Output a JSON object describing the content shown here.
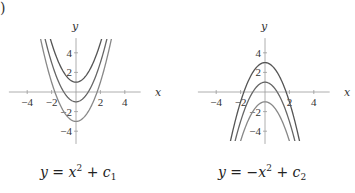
{
  "panel_label": ")",
  "chart_data": [
    {
      "type": "line",
      "title": "",
      "caption": "y = x^2 + c_1",
      "xlabel": "x",
      "ylabel": "y",
      "xlim": [
        -5,
        5
      ],
      "ylim": [
        -5,
        5
      ],
      "xticks": [
        -4,
        -2,
        2,
        4
      ],
      "yticks": [
        -4,
        -2,
        2,
        4
      ],
      "grid": false,
      "series": [
        {
          "name": "c1 = 1",
          "formula": "x^2 + 1",
          "c": 1
        },
        {
          "name": "c1 = -1",
          "formula": "x^2 - 1",
          "c": -1
        },
        {
          "name": "c1 = -3",
          "formula": "x^2 - 3",
          "c": -3
        }
      ],
      "sign": 1
    },
    {
      "type": "line",
      "title": "",
      "caption": "y = -x^2 + c_2",
      "xlabel": "x",
      "ylabel": "y",
      "xlim": [
        -5,
        5
      ],
      "ylim": [
        -5,
        5
      ],
      "xticks": [
        -4,
        -2,
        2,
        4
      ],
      "yticks": [
        -4,
        -2,
        2,
        4
      ],
      "grid": false,
      "series": [
        {
          "name": "c2 = 3",
          "formula": "-x^2 + 3",
          "c": 3
        },
        {
          "name": "c2 = 1",
          "formula": "-x^2 + 1",
          "c": 1
        },
        {
          "name": "c2 = -1",
          "formula": "-x^2 - 1",
          "c": -1
        }
      ],
      "sign": -1
    }
  ],
  "captions": {
    "left": {
      "lhs": "y",
      "eq": " = ",
      "var": "x",
      "sup": "2",
      "plus": " + ",
      "c": "c",
      "sub": "1"
    },
    "right": {
      "lhs": "y",
      "eq": " = −",
      "var": "x",
      "sup": "2",
      "plus": " + ",
      "c": "c",
      "sub": "2"
    }
  },
  "colors": {
    "curves": [
      "#555555",
      "#666666",
      "#888888"
    ],
    "axis": "#999999",
    "text": "#333333"
  }
}
